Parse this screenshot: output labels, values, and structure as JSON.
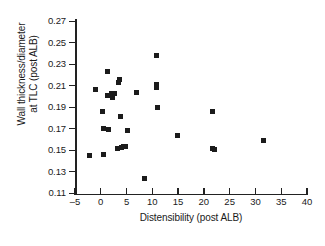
{
  "chart_data": {
    "type": "scatter",
    "title": "",
    "xlabel": "Distensibility (post ALB)",
    "ylabel": "Wall thickness/diameter at TLC (post ALB)",
    "ylabel_lines": [
      "Wall thickness/diameter",
      "at TLC (post ALB)"
    ],
    "xlim": [
      -5,
      40
    ],
    "ylim": [
      0.11,
      0.27
    ],
    "xticks": [
      -5,
      0,
      5,
      10,
      15,
      20,
      25,
      30,
      35,
      40
    ],
    "xtick_labels": [
      "–5",
      "0",
      "5",
      "10",
      "15",
      "20",
      "25",
      "30",
      "35",
      "40"
    ],
    "yticks": [
      0.11,
      0.13,
      0.15,
      0.17,
      0.19,
      0.21,
      0.23,
      0.25,
      0.27
    ],
    "ytick_labels": [
      "0.11",
      "0.13",
      "0.15",
      "0.17",
      "0.19",
      "0.21",
      "0.23",
      "0.25",
      "0.27"
    ],
    "grid": false,
    "legend": null,
    "marker": "square",
    "marker_color": "#1b1b1b",
    "points": [
      {
        "x": -2.1,
        "y": 0.145
      },
      {
        "x": -1.0,
        "y": 0.207
      },
      {
        "x": 0.4,
        "y": 0.186
      },
      {
        "x": 0.5,
        "y": 0.17
      },
      {
        "x": 0.6,
        "y": 0.146
      },
      {
        "x": 1.4,
        "y": 0.223
      },
      {
        "x": 1.4,
        "y": 0.201
      },
      {
        "x": 1.5,
        "y": 0.169
      },
      {
        "x": 2.1,
        "y": 0.203
      },
      {
        "x": 2.3,
        "y": 0.199
      },
      {
        "x": 2.7,
        "y": 0.203
      },
      {
        "x": 3.2,
        "y": 0.152
      },
      {
        "x": 3.5,
        "y": 0.213
      },
      {
        "x": 3.7,
        "y": 0.216
      },
      {
        "x": 3.8,
        "y": 0.181
      },
      {
        "x": 4.1,
        "y": 0.153
      },
      {
        "x": 4.4,
        "y": 0.154
      },
      {
        "x": 4.7,
        "y": 0.154
      },
      {
        "x": 5.2,
        "y": 0.168
      },
      {
        "x": 6.9,
        "y": 0.204
      },
      {
        "x": 8.4,
        "y": 0.124
      },
      {
        "x": 10.8,
        "y": 0.238
      },
      {
        "x": 10.9,
        "y": 0.211
      },
      {
        "x": 10.9,
        "y": 0.208
      },
      {
        "x": 11.0,
        "y": 0.19
      },
      {
        "x": 14.8,
        "y": 0.164
      },
      {
        "x": 21.6,
        "y": 0.186
      },
      {
        "x": 21.7,
        "y": 0.152
      },
      {
        "x": 22.0,
        "y": 0.151
      },
      {
        "x": 31.6,
        "y": 0.159
      }
    ]
  }
}
